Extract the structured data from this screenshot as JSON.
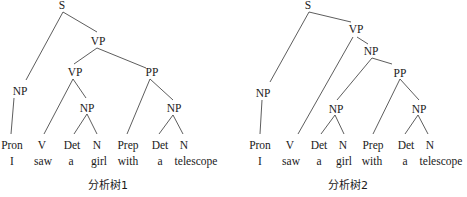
{
  "trees": [
    {
      "caption": "分析树1",
      "nodes": {
        "S": "S",
        "VP_top": "VP",
        "NP_subj": "NP",
        "VP_inner": "VP",
        "PP": "PP",
        "NP_obj": "NP",
        "NP_pp": "NP"
      },
      "leaves": [
        {
          "pos": "Pron",
          "word": "I"
        },
        {
          "pos": "V",
          "word": "saw"
        },
        {
          "pos": "Det",
          "word": "a"
        },
        {
          "pos": "N",
          "word": "girl"
        },
        {
          "pos": "Prep",
          "word": "with"
        },
        {
          "pos": "Det",
          "word": "a"
        },
        {
          "pos": "N",
          "word": "telescope"
        }
      ]
    },
    {
      "caption": "分析树2",
      "nodes": {
        "S": "S",
        "VP": "VP",
        "NP_subj": "NP",
        "NP_big": "NP",
        "PP": "PP",
        "NP_obj": "NP",
        "NP_pp": "NP"
      },
      "leaves": [
        {
          "pos": "Pron",
          "word": "I"
        },
        {
          "pos": "V",
          "word": "saw"
        },
        {
          "pos": "Det",
          "word": "a"
        },
        {
          "pos": "N",
          "word": "girl"
        },
        {
          "pos": "Prep",
          "word": "with"
        },
        {
          "pos": "Det",
          "word": "a"
        },
        {
          "pos": "N",
          "word": "telescope"
        }
      ]
    }
  ]
}
